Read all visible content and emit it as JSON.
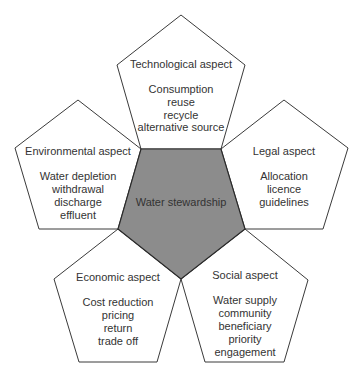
{
  "diagram": {
    "type": "pentagon-flower",
    "center": {
      "label": "Water stewardship",
      "fill": "#8c8c8c"
    },
    "petals": [
      {
        "id": "technological",
        "title": "Technological aspect",
        "items": [
          "Consumption",
          "reuse",
          "recycle",
          "alternative source"
        ]
      },
      {
        "id": "legal",
        "title": "Legal aspect",
        "items": [
          "Allocation",
          "licence",
          "guidelines"
        ]
      },
      {
        "id": "social",
        "title": "Social aspect",
        "items": [
          "Water supply",
          "community",
          "beneficiary",
          "priority",
          "engagement"
        ]
      },
      {
        "id": "economic",
        "title": "Economic aspect",
        "items": [
          "Cost reduction",
          "pricing",
          "return",
          "trade off"
        ]
      },
      {
        "id": "environmental",
        "title": "Environmental aspect",
        "items": [
          "Water depletion",
          "withdrawal",
          "discharge",
          "effluent"
        ]
      }
    ]
  }
}
